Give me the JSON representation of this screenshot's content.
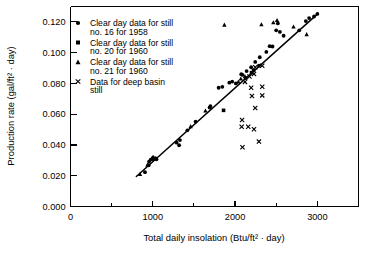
{
  "chart_data": {
    "type": "scatter",
    "title": "",
    "xlabel": "Total daily insolation (Btu/ft² · day)",
    "ylabel": "Production rate (gal/ft² · day)",
    "xlim": [
      0,
      3500
    ],
    "ylim": [
      0.0,
      0.13
    ],
    "grid": false,
    "legend_position": "upper-left-inside",
    "x_ticks_major": [
      0,
      1000,
      2000,
      3000
    ],
    "x_tick_labels": [
      "0",
      "1000",
      "2000",
      "3000"
    ],
    "x_ticks_minor": [
      500,
      1500,
      2500,
      3500
    ],
    "y_ticks_major": [
      0.0,
      0.02,
      0.04,
      0.06,
      0.08,
      0.1,
      0.12
    ],
    "y_tick_labels": [
      "0.000",
      "0.020",
      "0.040",
      "0.060",
      "0.080",
      "0.100",
      "0.120"
    ],
    "trendline": {
      "name": "fitted line",
      "x_start": 800,
      "y_start": 0.0195,
      "x_end": 3010,
      "y_end": 0.1255,
      "style": "solid"
    },
    "series": [
      {
        "name": "Clear day data for still no. 16 for 1958",
        "marker": "circle",
        "legend_label_line1": "Clear day data for still",
        "legend_label_line2": "no. 16 for 1958",
        "points": [
          [
            905,
            0.0223
          ],
          [
            950,
            0.0268
          ],
          [
            955,
            0.0292
          ],
          [
            975,
            0.0305
          ],
          [
            1000,
            0.0312
          ],
          [
            1010,
            0.0308
          ],
          [
            1030,
            0.0315
          ],
          [
            1045,
            0.0307
          ],
          [
            1290,
            0.0415
          ],
          [
            1320,
            0.0398
          ],
          [
            1330,
            0.0432
          ],
          [
            1420,
            0.0495
          ],
          [
            1520,
            0.0552
          ],
          [
            1690,
            0.0643
          ],
          [
            1700,
            0.0652
          ],
          [
            1800,
            0.0772
          ],
          [
            1845,
            0.0778
          ],
          [
            1930,
            0.0805
          ],
          [
            1965,
            0.0812
          ],
          [
            2010,
            0.08
          ],
          [
            2075,
            0.086
          ],
          [
            2090,
            0.0855
          ],
          [
            2140,
            0.088
          ],
          [
            2195,
            0.0905
          ],
          [
            2245,
            0.094
          ],
          [
            2290,
            0.0915
          ],
          [
            2300,
            0.097
          ],
          [
            2380,
            0.1005
          ],
          [
            2420,
            0.1042
          ],
          [
            2455,
            0.104
          ],
          [
            2500,
            0.1145
          ],
          [
            2520,
            0.119
          ],
          [
            2545,
            0.1135
          ],
          [
            2590,
            0.111
          ],
          [
            2780,
            0.1145
          ],
          [
            2860,
            0.1205
          ],
          [
            2900,
            0.1225
          ],
          [
            2960,
            0.1235
          ],
          [
            3000,
            0.1252
          ]
        ]
      },
      {
        "name": "Clear day data for still no. 20 for 1960",
        "marker": "square",
        "legend_label_line1": "Clear day data for still",
        "legend_label_line2": "no. 20 for 1960",
        "points": [
          [
            1000,
            0.031
          ],
          [
            1860,
            0.0625
          ],
          [
            2130,
            0.0835
          ],
          [
            2200,
            0.087
          ],
          [
            2225,
            0.0885
          ]
        ]
      },
      {
        "name": "Clear day data for still no. 21 for 1960",
        "marker": "triangle",
        "legend_label_line1": "Clear day data for still",
        "legend_label_line2": "no. 21 for 1960",
        "points": [
          [
            845,
            0.021
          ],
          [
            935,
            0.027
          ],
          [
            995,
            0.0318
          ],
          [
            1005,
            0.032
          ],
          [
            1460,
            0.052
          ],
          [
            1640,
            0.0622
          ],
          [
            1870,
            0.118
          ],
          [
            2040,
            0.081
          ],
          [
            2070,
            0.083
          ],
          [
            2120,
            0.0845
          ],
          [
            2320,
            0.1182
          ],
          [
            2465,
            0.1195
          ],
          [
            2510,
            0.121
          ],
          [
            2710,
            0.1168
          ],
          [
            2870,
            0.1118
          ]
        ]
      },
      {
        "name": "Data for deep basin still",
        "marker": "cross",
        "legend_label_line1": "Data for deep basin",
        "legend_label_line2": "still",
        "points": [
          [
            2120,
            0.081
          ],
          [
            2175,
            0.0845
          ],
          [
            2230,
            0.0862
          ],
          [
            2245,
            0.0905
          ],
          [
            2330,
            0.0915
          ],
          [
            2195,
            0.0772
          ],
          [
            2330,
            0.0778
          ],
          [
            2205,
            0.0718
          ],
          [
            2330,
            0.0722
          ],
          [
            2245,
            0.064
          ],
          [
            2085,
            0.0562
          ],
          [
            2080,
            0.0518
          ],
          [
            2160,
            0.0518
          ],
          [
            2230,
            0.0502
          ],
          [
            2090,
            0.0385
          ],
          [
            2290,
            0.0422
          ]
        ]
      }
    ]
  },
  "axis": {
    "y_title": "Production rate (gal/ft² · day)",
    "x_title": "Total daily insolation (Btu/ft² · day)"
  },
  "legend": {
    "entries": [
      {
        "marker": "circle",
        "line1": "Clear day data for still",
        "line2": "no. 16 for 1958"
      },
      {
        "marker": "square",
        "line1": "Clear day data for still",
        "line2": "no. 20 for 1960"
      },
      {
        "marker": "triangle",
        "line1": "Clear day data for still",
        "line2": "no. 21 for 1960"
      },
      {
        "marker": "cross",
        "line1": "Data for deep basin",
        "line2": "still"
      }
    ]
  },
  "colors": {
    "ink": "#000000",
    "background": "#ffffff"
  }
}
